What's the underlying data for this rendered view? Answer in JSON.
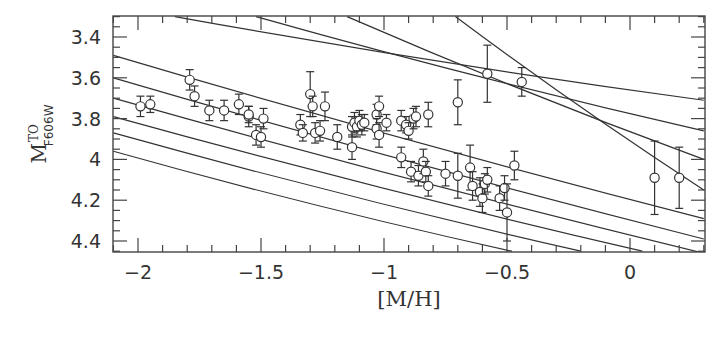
{
  "chart_data": {
    "type": "scatter",
    "title": "",
    "xlabel": "[M/H]",
    "ylabel": "M_F606W^TO",
    "ylabel_main": "M",
    "ylabel_sup": "TO",
    "ylabel_sub": "F606W",
    "xlim": [
      -2.1,
      0.3
    ],
    "ylim": [
      4.45,
      3.3
    ],
    "y_inverted": true,
    "grid": false,
    "legend": null,
    "xticks": [
      -2,
      -1.5,
      -1,
      -0.5,
      0
    ],
    "xtick_labels": [
      "−2",
      "−1.5",
      "−1",
      "−0.5",
      "0"
    ],
    "yticks": [
      3.4,
      3.6,
      3.8,
      4.0,
      4.2,
      4.4
    ],
    "ytick_labels": [
      "3.4",
      "3.6",
      "3.8",
      "4",
      "4.2",
      "4.4"
    ],
    "series": [
      {
        "name": "clusters",
        "marker": "open-circle",
        "points": [
          {
            "x": -1.99,
            "y": 3.74,
            "err": 0.05
          },
          {
            "x": -1.95,
            "y": 3.73,
            "err": 0.04
          },
          {
            "x": -1.79,
            "y": 3.61,
            "err": 0.05
          },
          {
            "x": -1.77,
            "y": 3.69,
            "err": 0.05
          },
          {
            "x": -1.71,
            "y": 3.76,
            "err": 0.05
          },
          {
            "x": -1.65,
            "y": 3.76,
            "err": 0.05
          },
          {
            "x": -1.59,
            "y": 3.73,
            "err": 0.05
          },
          {
            "x": -1.55,
            "y": 3.79,
            "err": 0.05
          },
          {
            "x": -1.55,
            "y": 3.78,
            "err": 0.04
          },
          {
            "x": -1.52,
            "y": 3.88,
            "err": 0.05
          },
          {
            "x": -1.5,
            "y": 3.89,
            "err": 0.05
          },
          {
            "x": -1.49,
            "y": 3.8,
            "err": 0.05
          },
          {
            "x": -1.34,
            "y": 3.83,
            "err": 0.05
          },
          {
            "x": -1.33,
            "y": 3.87,
            "err": 0.04
          },
          {
            "x": -1.3,
            "y": 3.68,
            "err": 0.11
          },
          {
            "x": -1.29,
            "y": 3.74,
            "err": 0.05
          },
          {
            "x": -1.28,
            "y": 3.87,
            "err": 0.05
          },
          {
            "x": -1.26,
            "y": 3.86,
            "err": 0.05
          },
          {
            "x": -1.24,
            "y": 3.74,
            "err": 0.07
          },
          {
            "x": -1.19,
            "y": 3.89,
            "err": 0.06
          },
          {
            "x": -1.13,
            "y": 3.84,
            "err": 0.05
          },
          {
            "x": -1.13,
            "y": 3.94,
            "err": 0.06
          },
          {
            "x": -1.12,
            "y": 3.82,
            "err": 0.05
          },
          {
            "x": -1.11,
            "y": 3.84,
            "err": 0.05
          },
          {
            "x": -1.1,
            "y": 3.81,
            "err": 0.05
          },
          {
            "x": -1.09,
            "y": 3.83,
            "err": 0.05
          },
          {
            "x": -1.08,
            "y": 3.82,
            "err": 0.04
          },
          {
            "x": -1.03,
            "y": 3.78,
            "err": 0.05
          },
          {
            "x": -1.02,
            "y": 3.74,
            "err": 0.05
          },
          {
            "x": -1.03,
            "y": 3.85,
            "err": 0.05
          },
          {
            "x": -1.02,
            "y": 3.88,
            "err": 0.06
          },
          {
            "x": -0.99,
            "y": 3.82,
            "err": 0.04
          },
          {
            "x": -0.93,
            "y": 3.81,
            "err": 0.05
          },
          {
            "x": -0.91,
            "y": 3.83,
            "err": 0.04
          },
          {
            "x": -0.9,
            "y": 3.86,
            "err": 0.04
          },
          {
            "x": -0.88,
            "y": 3.8,
            "err": 0.05
          },
          {
            "x": -0.87,
            "y": 3.79,
            "err": 0.05
          },
          {
            "x": -0.82,
            "y": 3.78,
            "err": 0.06
          },
          {
            "x": -0.93,
            "y": 3.99,
            "err": 0.05
          },
          {
            "x": -0.89,
            "y": 4.06,
            "err": 0.05
          },
          {
            "x": -0.86,
            "y": 4.08,
            "err": 0.05
          },
          {
            "x": -0.84,
            "y": 4.01,
            "err": 0.06
          },
          {
            "x": -0.83,
            "y": 4.06,
            "err": 0.05
          },
          {
            "x": -0.82,
            "y": 4.13,
            "err": 0.05
          },
          {
            "x": -0.75,
            "y": 4.07,
            "err": 0.06
          },
          {
            "x": -0.7,
            "y": 4.08,
            "err": 0.11
          },
          {
            "x": -0.65,
            "y": 4.04,
            "err": 0.11
          },
          {
            "x": -0.64,
            "y": 4.13,
            "err": 0.07
          },
          {
            "x": -0.61,
            "y": 4.16,
            "err": 0.07
          },
          {
            "x": -0.6,
            "y": 4.19,
            "err": 0.07
          },
          {
            "x": -0.59,
            "y": 4.12,
            "err": 0.05
          },
          {
            "x": -0.58,
            "y": 4.1,
            "err": 0.06
          },
          {
            "x": -0.53,
            "y": 4.19,
            "err": 0.06
          },
          {
            "x": -0.51,
            "y": 4.14,
            "err": 0.06
          },
          {
            "x": -0.5,
            "y": 4.26,
            "err": 0.14
          },
          {
            "x": -0.47,
            "y": 4.03,
            "err": 0.07
          },
          {
            "x": -0.7,
            "y": 3.72,
            "err": 0.11
          },
          {
            "x": -0.58,
            "y": 3.58,
            "err": 0.14
          },
          {
            "x": -0.44,
            "y": 3.62,
            "err": 0.07
          },
          {
            "x": 0.1,
            "y": 4.09,
            "err": 0.18
          },
          {
            "x": 0.2,
            "y": 4.09,
            "err": 0.15
          }
        ]
      }
    ],
    "isochrones": [
      {
        "name": "line-1",
        "points": [
          [
            -1.85,
            3.3
          ],
          [
            0.3,
            3.71
          ]
        ]
      },
      {
        "name": "line-2",
        "points": [
          [
            -1.52,
            3.3
          ],
          [
            0.3,
            3.86
          ]
        ]
      },
      {
        "name": "line-3",
        "points": [
          [
            -1.15,
            3.3
          ],
          [
            0.3,
            4.0
          ]
        ]
      },
      {
        "name": "line-4",
        "points": [
          [
            -0.71,
            3.3
          ],
          [
            0.3,
            4.15
          ]
        ]
      },
      {
        "name": "line-5",
        "points": [
          [
            -2.1,
            3.49
          ],
          [
            0.3,
            4.29
          ]
        ]
      },
      {
        "name": "line-6",
        "points": [
          [
            -2.1,
            3.6
          ],
          [
            0.3,
            4.39
          ]
        ]
      },
      {
        "name": "line-7",
        "points": [
          [
            -2.1,
            3.7
          ],
          [
            0.3,
            4.46
          ]
        ]
      },
      {
        "name": "line-8",
        "points": [
          [
            -2.1,
            3.79
          ],
          [
            0.05,
            4.45
          ]
        ]
      },
      {
        "name": "line-9",
        "points": [
          [
            -2.1,
            3.87
          ],
          [
            -0.2,
            4.45
          ]
        ]
      },
      {
        "name": "line-10",
        "points": [
          [
            -2.1,
            3.96
          ],
          [
            -0.48,
            4.45
          ]
        ]
      }
    ]
  }
}
